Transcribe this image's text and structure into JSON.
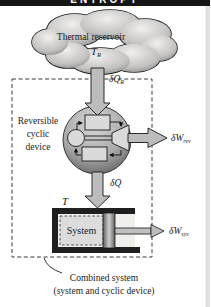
{
  "header": {
    "title": "ENTROPY"
  },
  "reservoir": {
    "name": "Thermal reservoir",
    "temp": "T",
    "temp_sub": "R"
  },
  "flows": {
    "heat_in": "δQ",
    "heat_in_sub": "R",
    "work_rev": "δW",
    "work_rev_sub": "rev",
    "heat_sys": "δQ",
    "work_sys": "δW",
    "work_sys_sub": "sys"
  },
  "device": {
    "line1": "Reversible",
    "line2": "cyclic",
    "line3": "device"
  },
  "system": {
    "label": "System",
    "temp": "T"
  },
  "caption": {
    "line1": "Combined system",
    "line2": "(system and cyclic device)"
  },
  "colors": {
    "header_bg": "#151515",
    "header_text": "#ffffff",
    "arrow_fill": "#bcbcbc",
    "outline": "#222222",
    "cloud_light": "#f0efed",
    "cloud_dark": "#8e8e8e",
    "sphere_light": "#d8d8d8",
    "sphere_dark": "#5c5c5c",
    "component_fill": "#dadada",
    "cylinder_wall": "#1f1f1f",
    "system_fill": "#dcdcdc",
    "page_edge": "#e2e1de"
  }
}
